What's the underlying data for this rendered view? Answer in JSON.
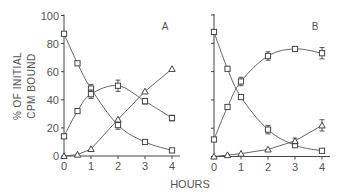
{
  "chart_data": [
    {
      "type": "line",
      "panel": "A",
      "title": "A",
      "xlabel": "HOURS",
      "ylabel": "% OF INITIAL CPM BOUND",
      "ylabel_lines": [
        "% OF INITIAL",
        "CPM BOUND"
      ],
      "xlim": [
        0,
        4
      ],
      "ylim": [
        0,
        100
      ],
      "xticks": [
        0,
        1,
        2,
        3,
        4
      ],
      "yticks": [
        0,
        20,
        40,
        60,
        80,
        100
      ],
      "grid": false,
      "series": [
        {
          "name": "decreasing",
          "marker": "square",
          "x": [
            0,
            0.5,
            1,
            2,
            3,
            4
          ],
          "y": [
            87,
            66,
            48,
            22,
            10,
            4
          ],
          "err": [
            1,
            1,
            3,
            3,
            1,
            1
          ]
        },
        {
          "name": "intermediate",
          "marker": "square",
          "x": [
            0,
            0.5,
            1,
            2,
            3,
            4
          ],
          "y": [
            14,
            32,
            44,
            50,
            39,
            27
          ],
          "err": [
            1,
            1,
            3,
            4,
            2,
            2
          ]
        },
        {
          "name": "increasing",
          "marker": "triangle",
          "x": [
            0,
            0.5,
            1,
            2,
            3,
            4
          ],
          "y": [
            0,
            1,
            5,
            26,
            46,
            62
          ],
          "err": [
            0,
            0,
            1,
            1,
            1,
            1
          ]
        }
      ]
    },
    {
      "type": "line",
      "panel": "B",
      "title": "B",
      "xlabel": "HOURS",
      "ylabel": "",
      "xlim": [
        0,
        4
      ],
      "ylim": [
        0,
        100
      ],
      "xticks": [
        0,
        1,
        2,
        3,
        4
      ],
      "yticks": [
        0,
        20,
        40,
        60,
        80,
        100
      ],
      "grid": false,
      "series": [
        {
          "name": "decreasing",
          "marker": "square",
          "x": [
            0,
            0.5,
            1,
            2,
            3,
            4
          ],
          "y": [
            88,
            62,
            42,
            19,
            8,
            4
          ],
          "err": [
            1,
            1,
            1,
            3,
            1,
            1
          ]
        },
        {
          "name": "intermediate",
          "marker": "square",
          "x": [
            0,
            0.5,
            1,
            2,
            3,
            4
          ],
          "y": [
            12,
            35,
            53,
            71,
            76,
            73
          ],
          "err": [
            1,
            1,
            3,
            3,
            1,
            4
          ]
        },
        {
          "name": "increasing",
          "marker": "triangle",
          "x": [
            0,
            0.5,
            1,
            2,
            3,
            4
          ],
          "y": [
            0,
            1,
            2,
            5,
            11,
            22
          ],
          "err": [
            0,
            0,
            1,
            1,
            2,
            4
          ]
        }
      ]
    }
  ]
}
